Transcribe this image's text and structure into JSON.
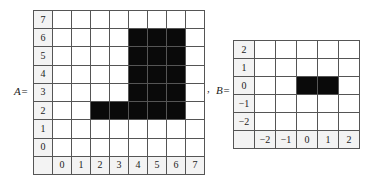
{
  "figure": {
    "matrix_a": {
      "label": "A=",
      "row_labels": [
        "7",
        "6",
        "5",
        "4",
        "3",
        "2",
        "1",
        "0"
      ],
      "col_labels": [
        "0",
        "1",
        "2",
        "3",
        "4",
        "5",
        "6",
        "7"
      ],
      "filled_cells": [
        {
          "row": "6",
          "cols": [
            "4",
            "5",
            "6"
          ]
        },
        {
          "row": "5",
          "cols": [
            "4",
            "5",
            "6"
          ]
        },
        {
          "row": "4",
          "cols": [
            "4",
            "5",
            "6"
          ]
        },
        {
          "row": "3",
          "cols": [
            "4",
            "5",
            "6"
          ]
        },
        {
          "row": "2",
          "cols": [
            "2",
            "3",
            "4",
            "5",
            "6"
          ]
        }
      ]
    },
    "separator": ",",
    "matrix_b": {
      "label": "B=",
      "row_labels": [
        "2",
        "1",
        "0",
        "−1",
        "−2"
      ],
      "col_labels": [
        "−2",
        "−1",
        "0",
        "1",
        "2"
      ],
      "filled_cells": [
        {
          "row": "0",
          "cols": [
            "0",
            "1"
          ]
        }
      ]
    },
    "colors": {
      "filled": "#0a0a0a",
      "empty": "#ffffff",
      "grid_line": "#555555"
    }
  }
}
